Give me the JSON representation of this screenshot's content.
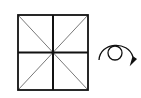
{
  "diagram": {
    "type": "origami-step",
    "paper": {
      "shape": "square",
      "creases": [
        "vertical-center",
        "horizontal-center",
        "diagonal-tl-br",
        "diagonal-tr-bl"
      ]
    },
    "symbol": {
      "name": "turn-over",
      "meaning": "Turn the model over"
    },
    "colors": {
      "stroke": "#111111",
      "crease": "#555555",
      "background": "#ffffff"
    }
  }
}
